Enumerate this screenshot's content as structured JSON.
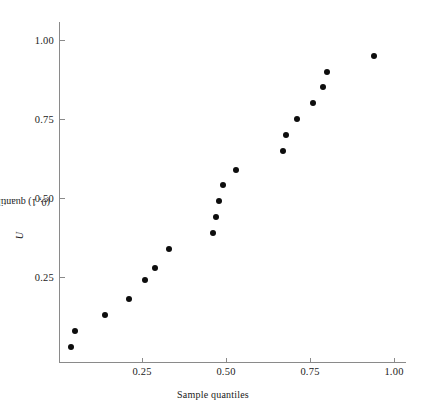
{
  "chart_data": {
    "type": "scatter",
    "title": "",
    "xlabel": "Sample quantiles",
    "ylabel": "U(0, 1) quantiles",
    "ylabel_prefix": "U",
    "ylabel_rest": "(0, 1) quantiles",
    "xlim": [
      0.0,
      1.05
    ],
    "ylim": [
      0.0,
      1.06
    ],
    "grid": false,
    "legend": null,
    "xticks": [
      0.25,
      0.5,
      0.75,
      1.0
    ],
    "xticklabels": [
      "0.25",
      "0.50",
      "0.75",
      "1.00"
    ],
    "yticks": [
      0.25,
      0.5,
      0.75,
      1.0
    ],
    "yticklabels": [
      "0.25",
      "0.50",
      "0.75",
      "1.00"
    ],
    "marker": "filled-circle",
    "marker_color": "#0d0d0d",
    "axis_color": "#8a8a8a",
    "background_color": "#ffffff",
    "n_points": 19,
    "x": [
      0.04,
      0.05,
      0.14,
      0.21,
      0.26,
      0.29,
      0.33,
      0.46,
      0.47,
      0.48,
      0.49,
      0.53,
      0.67,
      0.68,
      0.71,
      0.76,
      0.79,
      0.8,
      0.94
    ],
    "y": [
      0.03,
      0.08,
      0.13,
      0.18,
      0.24,
      0.28,
      0.34,
      0.39,
      0.44,
      0.49,
      0.54,
      0.59,
      0.65,
      0.7,
      0.75,
      0.8,
      0.85,
      0.9,
      0.95
    ],
    "points": [
      {
        "x": 0.04,
        "y": 0.03
      },
      {
        "x": 0.05,
        "y": 0.08
      },
      {
        "x": 0.14,
        "y": 0.13
      },
      {
        "x": 0.21,
        "y": 0.18
      },
      {
        "x": 0.26,
        "y": 0.24
      },
      {
        "x": 0.29,
        "y": 0.28
      },
      {
        "x": 0.33,
        "y": 0.34
      },
      {
        "x": 0.46,
        "y": 0.39
      },
      {
        "x": 0.47,
        "y": 0.44
      },
      {
        "x": 0.48,
        "y": 0.49
      },
      {
        "x": 0.49,
        "y": 0.54
      },
      {
        "x": 0.53,
        "y": 0.59
      },
      {
        "x": 0.67,
        "y": 0.65
      },
      {
        "x": 0.68,
        "y": 0.7
      },
      {
        "x": 0.71,
        "y": 0.75
      },
      {
        "x": 0.76,
        "y": 0.8
      },
      {
        "x": 0.79,
        "y": 0.85
      },
      {
        "x": 0.8,
        "y": 0.9
      },
      {
        "x": 0.94,
        "y": 0.95
      }
    ]
  },
  "geometry": {
    "x_origin_px": 58,
    "y_origin_px": 356,
    "px_per_unit_x": 336,
    "px_per_unit_y": 316
  }
}
